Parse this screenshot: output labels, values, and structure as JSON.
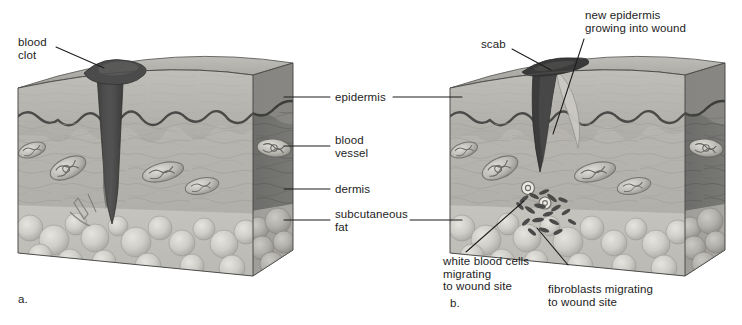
{
  "figure": {
    "type": "diagram",
    "background_color": "#ffffff",
    "text_color": "#1d1d1d",
    "leader_line_color": "#1d1d1d"
  },
  "panels": [
    {
      "id": "a",
      "caption": "a.",
      "description": "Skin block with fresh wound and blood clot"
    },
    {
      "id": "b",
      "caption": "b.",
      "description": "Skin block with scab, new epidermis, migrating white blood cells and fibroblasts"
    }
  ],
  "labels": {
    "blood_clot": "blood\nclot",
    "scab": "scab",
    "new_epidermis": "new epidermis\ngrowing into wound",
    "epidermis": "epidermis",
    "blood_vessel": "blood\nvessel",
    "dermis": "dermis",
    "subcutaneous_fat": "subcutaneous\nfat",
    "white_blood_cells": "white blood cells\nmigrating\nto wound site",
    "fibroblasts": "fibroblasts migrating\nto wound site"
  },
  "layers": {
    "epidermis_color": "#8c8c8c",
    "dermis_color": "#b4b2ad",
    "dermis_side_color": "#6f6f6f",
    "fat_color": "#c9c7c2",
    "top_surface_color": "#a9a7a2",
    "clot_color": "#4a4a4a",
    "scab_color": "#3c3c3c",
    "outline_color": "#4d4d4d"
  },
  "caption_a": "a.",
  "caption_b": "b."
}
